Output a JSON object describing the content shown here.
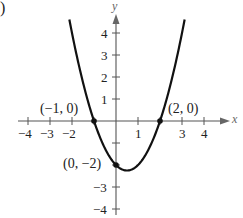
{
  "panel_label": ")",
  "chart_data": {
    "type": "line",
    "title": "",
    "function": "y = x^2 - x - 2",
    "xlabel": "x",
    "ylabel": "y",
    "xlim": [
      -4.5,
      5
    ],
    "ylim": [
      -4.5,
      5
    ],
    "grid": false,
    "x_ticks": [
      -4,
      -3,
      -2,
      -1,
      1,
      2,
      3,
      4
    ],
    "x_tick_labels": [
      "-4",
      "-3",
      "-2",
      "",
      "1",
      "",
      "3",
      "4"
    ],
    "y_ticks": [
      -4,
      -3,
      -2,
      -1,
      1,
      2,
      3,
      4
    ],
    "y_tick_labels": [
      "-4",
      "-3",
      "",
      "",
      "1",
      "2",
      "3",
      "4"
    ],
    "series": [
      {
        "name": "parabola",
        "x": [
          -2.1,
          -1.5,
          -1,
          -0.5,
          0,
          0.5,
          1,
          1.5,
          2,
          2.5,
          3.1
        ],
        "y": [
          4.51,
          1.75,
          0,
          -1.25,
          -2,
          -2.25,
          -2,
          -1.25,
          0,
          1.75,
          4.51
        ]
      }
    ],
    "points": [
      {
        "x": -1,
        "y": 0,
        "label": "(−1, 0)"
      },
      {
        "x": 2,
        "y": 0,
        "label": "(2, 0)"
      },
      {
        "x": 0,
        "y": -2,
        "label": "(0, −2)"
      }
    ]
  },
  "labels": {
    "x_axis": "x",
    "y_axis": "y",
    "xt_m4": "−4",
    "xt_m3": "−3",
    "xt_m2": "−2",
    "xt_1": "1",
    "xt_3": "3",
    "xt_4": "4",
    "yt_4": "4",
    "yt_3": "3",
    "yt_2": "2",
    "yt_1": "1",
    "yt_m3": "−3",
    "yt_m4": "−4",
    "pt_a": "(−1, 0)",
    "pt_b": "(2, 0)",
    "pt_c": "(0, −2)"
  }
}
